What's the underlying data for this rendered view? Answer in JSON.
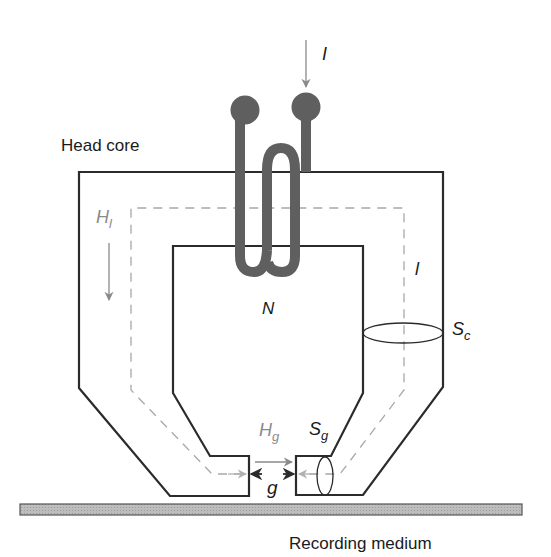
{
  "diagram": {
    "labels": {
      "head_core": "Head core",
      "recording_medium": "Recording medium",
      "current": "I",
      "turns": "N",
      "path_length": "l",
      "core_field_main": "H",
      "core_field_sub": "l",
      "gap_field_main": "H",
      "gap_field_sub": "g",
      "gap_area_main": "S",
      "gap_area_sub": "g",
      "core_area_main": "S",
      "core_area_sub": "c",
      "gap_length": "g"
    },
    "colors": {
      "core_outline": "#2b2b2b",
      "coil": "#5f5f5f",
      "flux_path": "#a8a8a8",
      "medium_fill": "#b5b5b5",
      "medium_outline": "#555555",
      "arrow_grey": "#8a8a8a"
    }
  }
}
